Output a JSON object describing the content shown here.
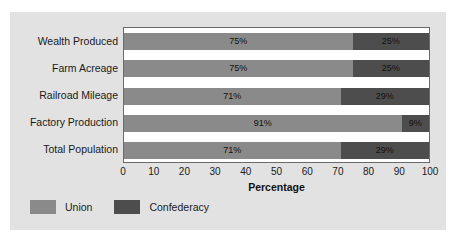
{
  "chart_data": {
    "type": "bar",
    "orientation": "horizontal",
    "stacked": true,
    "stacked_percent": true,
    "title": "",
    "xlabel": "Percentage",
    "ylabel": "",
    "xlim": [
      0,
      100
    ],
    "xticks": [
      0,
      10,
      20,
      30,
      40,
      50,
      60,
      70,
      80,
      90,
      100
    ],
    "xticklabels": [
      "0",
      "10",
      "20",
      "30",
      "40",
      "50",
      "60",
      "70",
      "80",
      "90",
      "100"
    ],
    "grid": false,
    "legend_position": "bottom-left",
    "categories": [
      "Wealth Produced",
      "Farm Acreage",
      "Railroad Mileage",
      "Factory Production",
      "Total Population"
    ],
    "series": [
      {
        "name": "Union",
        "color": "#8a8a8a",
        "values": [
          75,
          75,
          71,
          91,
          71
        ],
        "labels": [
          "75%",
          "75%",
          "71%",
          "91%",
          "71%"
        ]
      },
      {
        "name": "Confederacy",
        "color": "#4d4d4d",
        "values": [
          25,
          25,
          29,
          9,
          29
        ],
        "labels": [
          "25%",
          "25%",
          "29%",
          "9%",
          "29%"
        ]
      }
    ]
  },
  "legend": {
    "items": [
      {
        "label": "Union",
        "color": "#8a8a8a"
      },
      {
        "label": "Confederacy",
        "color": "#4d4d4d"
      }
    ]
  },
  "colors": {
    "union": "#8a8a8a",
    "confederacy": "#4d4d4d",
    "figure_background": "#e2e2e2",
    "plot_background": "#ffffff",
    "axis_line": "#6a6a6a"
  }
}
